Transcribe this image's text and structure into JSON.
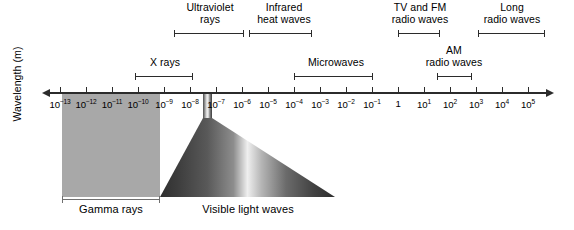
{
  "axis": {
    "title": "Wavelength (m)",
    "ticks": [
      {
        "mantissa": "10",
        "exp": "-13",
        "x": 0
      },
      {
        "mantissa": "10",
        "exp": "-12",
        "x": 26
      },
      {
        "mantissa": "10",
        "exp": "-11",
        "x": 52
      },
      {
        "mantissa": "10",
        "exp": "-10",
        "x": 78
      },
      {
        "mantissa": "10",
        "exp": "-9",
        "x": 104
      },
      {
        "mantissa": "10",
        "exp": "-8",
        "x": 130
      },
      {
        "mantissa": "10",
        "exp": "-7",
        "x": 156
      },
      {
        "mantissa": "10",
        "exp": "-6",
        "x": 182
      },
      {
        "mantissa": "10",
        "exp": "-5",
        "x": 208
      },
      {
        "mantissa": "10",
        "exp": "-4",
        "x": 234
      },
      {
        "mantissa": "10",
        "exp": "-3",
        "x": 260
      },
      {
        "mantissa": "10",
        "exp": "-2",
        "x": 286
      },
      {
        "mantissa": "10",
        "exp": "-1",
        "x": 312
      },
      {
        "mantissa": "1",
        "exp": "",
        "x": 338
      },
      {
        "mantissa": "10",
        "exp": "1",
        "x": 364
      },
      {
        "mantissa": "10",
        "exp": "2",
        "x": 390
      },
      {
        "mantissa": "10",
        "exp": "3",
        "x": 416
      },
      {
        "mantissa": "10",
        "exp": "4",
        "x": 442
      },
      {
        "mantissa": "10",
        "exp": "5",
        "x": 468
      }
    ],
    "range_min": "10^-13",
    "range_max": "10^5",
    "direction": "both-arrows"
  },
  "bands": [
    {
      "name": "ultraviolet",
      "label": "Ultraviolet\nrays",
      "row": "top",
      "label_left": 165,
      "label_top": 2,
      "label_width": 90,
      "bracket_left": 174,
      "bracket_width": 70,
      "bracket_top": 30
    },
    {
      "name": "infrared",
      "label": "Infrared\nheat waves",
      "row": "top",
      "label_left": 238,
      "label_top": 2,
      "label_width": 92,
      "bracket_left": 249,
      "bracket_width": 63,
      "bracket_top": 30
    },
    {
      "name": "tv-fm-radio",
      "label": "TV and FM\nradio waves",
      "row": "top",
      "label_left": 374,
      "label_top": 2,
      "label_width": 92,
      "bracket_left": 398,
      "bracket_width": 42,
      "bracket_top": 30
    },
    {
      "name": "long-radio",
      "label": "Long\nradio waves",
      "row": "top",
      "label_left": 466,
      "label_top": 2,
      "label_width": 92,
      "bracket_left": 478,
      "bracket_width": 67,
      "bracket_top": 30
    },
    {
      "name": "x-rays",
      "label": "X rays",
      "row": "mid",
      "label_left": 125,
      "label_top": 57,
      "label_width": 80,
      "bracket_left": 135,
      "bracket_width": 58,
      "bracket_top": 73
    },
    {
      "name": "microwaves",
      "label": "Microwaves",
      "row": "mid",
      "label_left": 291,
      "label_top": 57,
      "label_width": 90,
      "bracket_left": 294,
      "bracket_width": 79,
      "bracket_top": 73
    },
    {
      "name": "am-radio",
      "label": "AM\nradio waves",
      "row": "mid",
      "label_left": 408,
      "label_top": 45,
      "label_width": 92,
      "bracket_left": 437,
      "bracket_width": 35,
      "bracket_top": 73
    }
  ],
  "blocks": [
    {
      "name": "gamma-rays",
      "caption": "Gamma rays",
      "caption_left": 60,
      "caption_top": 203,
      "caption_width": 102
    },
    {
      "name": "visible-light",
      "caption": "Visible light waves",
      "caption_left": 178,
      "caption_top": 203,
      "caption_width": 140
    }
  ],
  "colors": {
    "ink": "#2b2b2b",
    "gamma_fill": "#a8a8a8",
    "visible_core": "#f2f2f2",
    "visible_edge": "#3a3a3a",
    "background": "#ffffff"
  }
}
